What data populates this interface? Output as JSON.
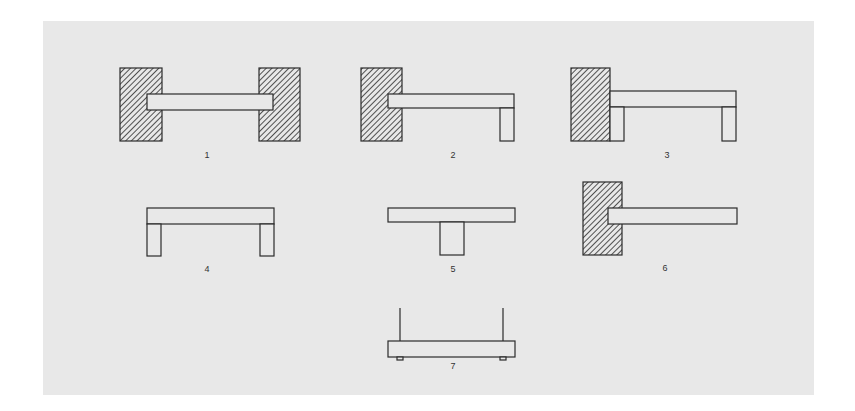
{
  "diagram": {
    "background": "#e8e8e8",
    "stroke": "#2a2a2a",
    "fill": "#e8e8e8",
    "hatch": "#2a2a2a",
    "figures": [
      {
        "label": "1",
        "description": "beam embedded in walls at both ends"
      },
      {
        "label": "2",
        "description": "beam embedded in left wall, supported by post at right"
      },
      {
        "label": "3",
        "description": "beam on left wall with posts at both ends"
      },
      {
        "label": "4",
        "description": "beam resting on two posts"
      },
      {
        "label": "5",
        "description": "beam balanced on central post (T shape)"
      },
      {
        "label": "6",
        "description": "cantilever beam embedded in left wall"
      },
      {
        "label": "7",
        "description": "beam suspended from two wires"
      }
    ]
  }
}
